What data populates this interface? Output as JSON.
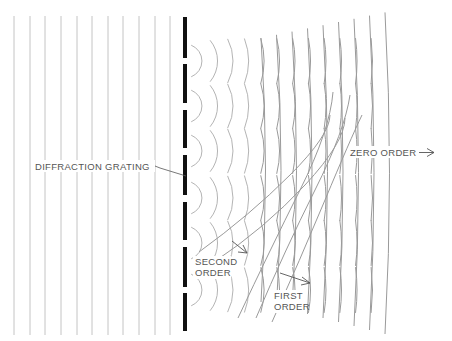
{
  "diagram": {
    "type": "diffraction-grating-wavefronts",
    "labels": {
      "grating": "DIFFRACTION GRATING",
      "zero_order": "ZERO ORDER",
      "second_order_line1": "SECOND",
      "second_order_line2": "ORDER",
      "first_order_line1": "FIRST",
      "first_order_line2": "ORDER"
    },
    "colors": {
      "background": "#ffffff",
      "incident_wave": "#c4c4c4",
      "grating_bar": "#111111",
      "wavelet": "#b4b4b4",
      "wavefront": "#9a9a9a",
      "label": "#555555"
    },
    "incident_plane_waves_x": [
      14,
      30,
      45,
      61,
      77,
      92,
      108,
      123,
      139,
      155,
      170
    ],
    "incident_wave_y_range": [
      16,
      335
    ],
    "grating": {
      "x": 185,
      "width": 4,
      "segments": [
        [
          17,
          58
        ],
        [
          64,
          103
        ],
        [
          110,
          148
        ],
        [
          155,
          195
        ],
        [
          202,
          240
        ],
        [
          247,
          287
        ],
        [
          293,
          331
        ]
      ],
      "slit_centers_y": [
        61,
        106,
        151,
        198,
        243,
        290
      ]
    }
  }
}
